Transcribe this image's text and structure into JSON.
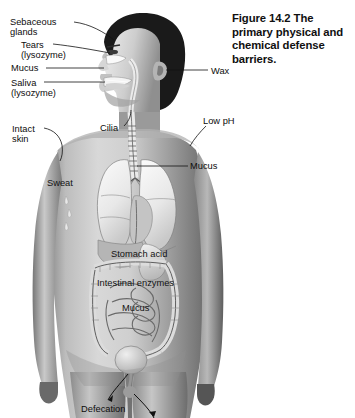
{
  "figure": {
    "caption": "Figure 14.2  The primary physical and chemical defense barriers.",
    "background_color": "#ffffff",
    "text_color": "#0d0d0d",
    "leader_color": "#111111"
  },
  "labels": {
    "sebaceous_glands": "Sebaceous\nglands",
    "tears": "Tears\n(lysozyme)",
    "mucus_nose": "Mucus",
    "saliva": "Saliva\n(lysozyme)",
    "wax": "Wax",
    "intact_skin": "Intact\nskin",
    "cilia": "Cilia",
    "low_ph": "Low pH",
    "sweat": "Sweat",
    "mucus_lung": "Mucus",
    "stomach_acid": "Stomach acid",
    "intestinal_enzymes": "Intestinal enzymes",
    "mucus_gut": "Mucus",
    "defecation": "Defecation"
  },
  "anatomy": {
    "subject": "human-male-torso-anterior-with-sagittal-head",
    "structures": [
      "hair",
      "face-profile",
      "nasal-cavity",
      "oral-cavity",
      "tongue",
      "ear",
      "neck",
      "trachea",
      "left-lung",
      "right-lung",
      "bronchi",
      "diaphragm",
      "liver",
      "stomach",
      "large-intestine",
      "small-intestine",
      "bladder",
      "arms",
      "legs",
      "skin"
    ]
  }
}
